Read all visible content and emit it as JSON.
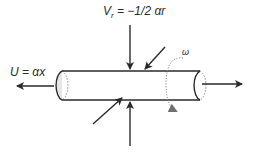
{
  "diagram": {
    "type": "fluid-flow-schematic",
    "labels": {
      "radial_velocity_prefix": "V",
      "radial_velocity_subscript": "r",
      "radial_velocity_rhs": " = −1/2 αr",
      "axial_velocity": "U = αx",
      "rotation": "ω"
    },
    "elements": {
      "cylinder": "horizontal tube with shaded left end cap and dotted rear edges",
      "axial_arrows": [
        "left outflow arrow",
        "right outflow arrow"
      ],
      "radial_arrows": [
        "top vertical inflow",
        "bottom vertical inflow",
        "upper-right diagonal inflow",
        "lower-left diagonal inflow"
      ],
      "rotation_indicator": "dotted circular arrow around right part of tube"
    },
    "colors": {
      "stroke": "#2a2a2a",
      "cap_fill": "#e6e6e6",
      "dotted": "#8a8a8a"
    }
  }
}
